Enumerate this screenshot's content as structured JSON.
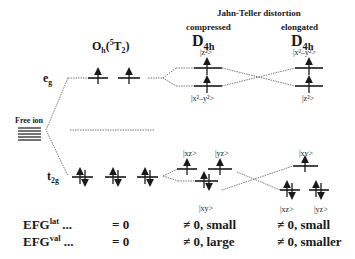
{
  "title": "Jahn-Teller distortion",
  "columns": {
    "free_ion": {
      "label": "Free ion"
    },
    "octahedral": {
      "symmetry": "O",
      "symmetry_sub": "h",
      "term": "(",
      "term_sup": "5",
      "term_main": "T",
      "term_sub": "2",
      "term_close": ")"
    },
    "compressed": {
      "caption": "compressed",
      "symmetry": "D",
      "symmetry_sub": "4h"
    },
    "elongated": {
      "caption": "elongated",
      "symmetry": "D",
      "symmetry_sub": "4h"
    }
  },
  "levels": {
    "eg": {
      "main": "e",
      "sub": "g"
    },
    "t2g": {
      "main": "t",
      "sub": "2g"
    }
  },
  "orbitals": {
    "compressed_upper_e": "|z²>",
    "compressed_lower_e": "|x²–y²>",
    "compressed_upper_t_left": "|xz>",
    "compressed_upper_t_right": "|yz>",
    "compressed_lower_t": "|xy>",
    "elongated_upper_e": "|x²–y²>",
    "elongated_lower_e": "|z²>",
    "elongated_upper_t": "|xy>",
    "elongated_lower_t_left": "|xz>",
    "elongated_lower_t_right": "|yz>"
  },
  "efg_rows": [
    {
      "label": "EFG",
      "sup": "lat",
      "dots": "...",
      "oh": "= 0",
      "compressed": "≠ 0, small",
      "elongated": "≠ 0, small"
    },
    {
      "label": "EFG",
      "sup": "val",
      "dots": "...",
      "oh": "= 0",
      "compressed": "≠ 0, large",
      "elongated": "≠ 0, smaller"
    }
  ],
  "colors": {
    "ink": "#1a1a1a",
    "dotted": "#555555",
    "background": "#ffffff"
  }
}
